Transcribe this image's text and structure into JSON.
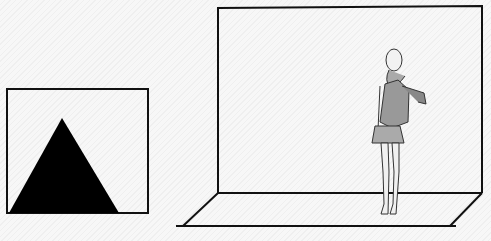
{
  "diagram": {
    "left_panel": {
      "shape": "triangle",
      "fill": "#000000",
      "frame_color": "#111111"
    },
    "right_panel": {
      "elements": [
        "backdrop-frame",
        "floor-plane",
        "standing-figure"
      ],
      "frame_color": "#111111",
      "figure": {
        "pose": "standing, hand on hip",
        "clothing": [
          "scarf",
          "jacket",
          "sweater",
          "pleated skirt"
        ]
      }
    }
  }
}
